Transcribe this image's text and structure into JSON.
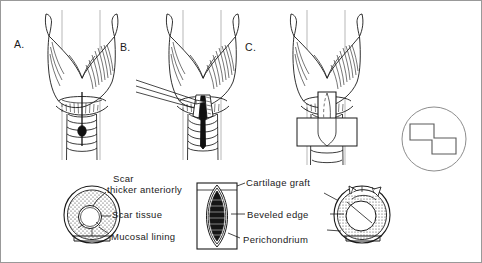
{
  "figure": {
    "background_color": "#ffffff",
    "ink_color": "#1a1a1a",
    "width": 482,
    "height": 263
  },
  "panels": [
    {
      "id": "A",
      "letter": "A.",
      "caption": "Anterior larynx and trachea with midline incision line and tracheostomy stoma"
    },
    {
      "id": "B",
      "letter": "B.",
      "caption": "Anterior laryngofissure incision made with knife through cricoid and upper trachea"
    },
    {
      "id": "C",
      "letter": "C.",
      "caption": "Cartilage graft positioned in the anterior split with rectangular donor graft below"
    }
  ],
  "annotations": {
    "left_cross_section": {
      "name": "stenotic-airway-cross-section",
      "labels": [
        {
          "id": "scar-thicker-anteriorly",
          "line1": "Scar",
          "line2": "thicker anteriorly"
        },
        {
          "id": "scar-tissue",
          "text": "Scar tissue"
        },
        {
          "id": "mucosal-lining",
          "text": "Mucosal lining"
        }
      ]
    },
    "middle_graft": {
      "name": "cartilage-graft-detail",
      "labels": [
        {
          "id": "cartilage-graft",
          "text": "Cartilage graft"
        },
        {
          "id": "beveled-edge",
          "text": "Beveled edge"
        },
        {
          "id": "perichondrium",
          "text": "Perichondrium"
        }
      ]
    },
    "right_cross_section": {
      "name": "reconstructed-airway-cross-section"
    }
  },
  "inset": {
    "name": "step-graft-inset",
    "shape": "circle-with-z-step-rectangle"
  }
}
